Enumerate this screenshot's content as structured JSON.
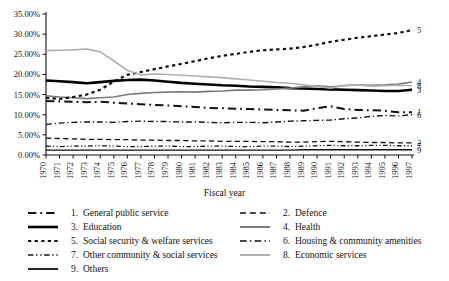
{
  "chart_data": {
    "type": "line",
    "title": "",
    "xlabel": "Fiscal year",
    "ylabel": "",
    "ylim": [
      0,
      35
    ],
    "ytick_labels": [
      "0.00%",
      "5.00%",
      "10.00%",
      "15.00%",
      "20.00%",
      "25.00%",
      "30.00%",
      "35.00%"
    ],
    "ytick_values": [
      0,
      5,
      10,
      15,
      20,
      25,
      30,
      35
    ],
    "grid": false,
    "legend_position": "below",
    "categories": [
      "1970",
      "1971",
      "1972",
      "1973",
      "1974",
      "1975",
      "1976",
      "1977",
      "1978",
      "1979",
      "1980",
      "1981",
      "1982",
      "1983",
      "1984",
      "1985",
      "1986",
      "1987",
      "1988",
      "1989",
      "1990",
      "1991",
      "1992",
      "1993",
      "1994",
      "1995",
      "1996",
      "1997"
    ],
    "series": [
      {
        "name": "1. General public service",
        "number": "1",
        "style": "dash-dot",
        "color": "#111111",
        "width": 2.0,
        "end_label": "1",
        "values": [
          13.4,
          13.3,
          13.2,
          13.1,
          13.2,
          13.0,
          12.8,
          12.6,
          12.4,
          12.3,
          12.1,
          11.9,
          11.7,
          11.6,
          11.5,
          11.4,
          11.3,
          11.2,
          11.1,
          11.0,
          11.6,
          12.1,
          11.4,
          11.2,
          11.1,
          11.0,
          10.6,
          10.6
        ]
      },
      {
        "name": "2. Defence",
        "number": "2",
        "style": "dashed",
        "color": "#111111",
        "width": 1.3,
        "end_label": "2",
        "values": [
          4.2,
          4.1,
          4.0,
          3.9,
          3.9,
          3.8,
          3.8,
          3.7,
          3.7,
          3.6,
          3.6,
          3.5,
          3.5,
          3.4,
          3.4,
          3.4,
          3.3,
          3.3,
          3.2,
          3.2,
          3.3,
          3.4,
          3.3,
          3.2,
          3.1,
          3.1,
          3.0,
          3.0
        ]
      },
      {
        "name": "3. Education",
        "number": "3",
        "style": "solid",
        "color": "#000000",
        "width": 2.6,
        "end_label": "3",
        "values": [
          18.5,
          18.3,
          18.1,
          17.8,
          18.1,
          18.4,
          18.6,
          18.7,
          18.5,
          18.2,
          17.9,
          17.7,
          17.5,
          17.3,
          17.2,
          17.0,
          16.9,
          16.8,
          16.6,
          16.5,
          16.4,
          16.3,
          16.2,
          16.1,
          16.0,
          15.9,
          15.9,
          16.2
        ]
      },
      {
        "name": "4. Health",
        "number": "4",
        "style": "solid",
        "color": "#7a7a7a",
        "width": 1.6,
        "end_label": "4",
        "values": [
          14.7,
          14.4,
          14.2,
          14.0,
          14.2,
          14.4,
          15.0,
          15.3,
          15.5,
          15.6,
          15.7,
          15.6,
          15.8,
          15.9,
          16.1,
          16.1,
          16.2,
          16.4,
          16.6,
          16.9,
          17.2,
          16.9,
          17.2,
          17.4,
          17.3,
          17.4,
          17.6,
          18.1
        ]
      },
      {
        "name": "5. Social security & welfare services",
        "number": "5",
        "style": "dotted",
        "color": "#111111",
        "width": 2.2,
        "end_label": "5",
        "values": [
          14.2,
          13.9,
          14.4,
          15.0,
          16.2,
          18.2,
          19.9,
          20.6,
          21.3,
          22.0,
          22.6,
          23.3,
          24.0,
          24.6,
          25.1,
          25.6,
          26.0,
          26.2,
          26.4,
          26.8,
          27.4,
          28.1,
          28.6,
          29.1,
          29.5,
          29.9,
          30.3,
          31.0
        ]
      },
      {
        "name": "6. Housing & community amenities",
        "number": "6",
        "style": "dash-dot",
        "color": "#111111",
        "width": 1.4,
        "end_label": "6",
        "values": [
          7.6,
          7.9,
          8.1,
          8.2,
          8.2,
          8.1,
          8.3,
          8.4,
          8.3,
          8.3,
          8.2,
          8.2,
          8.1,
          8.0,
          8.1,
          8.1,
          8.0,
          8.2,
          8.4,
          8.5,
          8.6,
          8.7,
          9.0,
          9.2,
          9.6,
          9.8,
          9.7,
          10.0
        ]
      },
      {
        "name": "7. Other community & social services",
        "number": "7",
        "style": "dash-dot-dot",
        "color": "#111111",
        "width": 1.3,
        "end_label": "7",
        "values": [
          2.2,
          2.1,
          2.2,
          2.2,
          2.3,
          2.2,
          2.1,
          2.1,
          2.2,
          2.2,
          2.1,
          2.1,
          2.2,
          2.2,
          2.1,
          2.1,
          2.2,
          2.2,
          2.1,
          2.2,
          2.3,
          2.4,
          2.3,
          2.3,
          2.4,
          2.4,
          2.3,
          2.3
        ]
      },
      {
        "name": "8. Economic services",
        "number": "8",
        "style": "solid",
        "color": "#b0b0b0",
        "width": 1.6,
        "end_label": "8",
        "values": [
          25.9,
          26.0,
          26.1,
          26.3,
          25.6,
          23.4,
          21.0,
          19.9,
          20.1,
          20.0,
          19.8,
          19.6,
          19.4,
          19.2,
          18.9,
          18.6,
          18.3,
          18.0,
          17.8,
          17.4,
          17.0,
          16.6,
          17.3,
          17.4,
          17.1,
          17.2,
          17.3,
          17.2
        ]
      },
      {
        "name": "9. Others",
        "number": "9",
        "style": "solid",
        "color": "#111111",
        "width": 1.3,
        "end_label": "9",
        "values": [
          1.2,
          1.2,
          1.2,
          1.2,
          1.2,
          1.2,
          1.2,
          1.2,
          1.2,
          1.2,
          1.2,
          1.2,
          1.2,
          1.2,
          1.2,
          1.2,
          1.2,
          1.2,
          1.2,
          1.3,
          1.3,
          1.3,
          1.3,
          1.3,
          1.3,
          1.3,
          1.3,
          1.3
        ]
      }
    ]
  },
  "legend": {
    "items": [
      {
        "number": "1.",
        "label": "General public service",
        "style": "dash-dot",
        "color": "#111111",
        "width": 2.0
      },
      {
        "number": "2.",
        "label": "Defence",
        "style": "dashed",
        "color": "#111111",
        "width": 1.5
      },
      {
        "number": "3.",
        "label": "Education",
        "style": "solid",
        "color": "#000000",
        "width": 2.6
      },
      {
        "number": "4.",
        "label": "Health",
        "style": "solid",
        "color": "#7a7a7a",
        "width": 2.0
      },
      {
        "number": "5.",
        "label": "Social security & welfare services",
        "style": "dotted",
        "color": "#111111",
        "width": 2.2
      },
      {
        "number": "6.",
        "label": "Housing & community amenities",
        "style": "dash-dot",
        "color": "#111111",
        "width": 1.6
      },
      {
        "number": "7.",
        "label": "Other community & social services",
        "style": "dash-dot-dot",
        "color": "#111111",
        "width": 1.5
      },
      {
        "number": "8.",
        "label": "Economic services",
        "style": "solid",
        "color": "#b0b0b0",
        "width": 2.0
      },
      {
        "number": "9.",
        "label": "Others",
        "style": "solid",
        "color": "#111111",
        "width": 1.8
      }
    ]
  }
}
